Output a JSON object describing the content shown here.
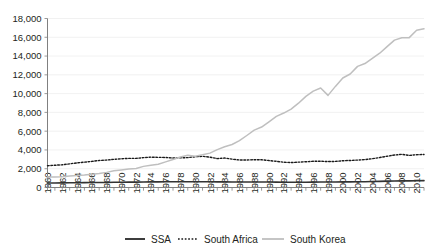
{
  "chart_data": {
    "type": "line",
    "title": "",
    "xlabel": "",
    "ylabel": "",
    "ylim": [
      0,
      18000
    ],
    "xlim": [
      1960,
      2011
    ],
    "grid": true,
    "legend_position": "bottom",
    "y_ticks": [
      "0",
      "2,000",
      "4,000",
      "6,000",
      "8,000",
      "10,000",
      "12,000",
      "14,000",
      "16,000",
      "18,000"
    ],
    "y_tick_values": [
      0,
      2000,
      4000,
      6000,
      8000,
      10000,
      12000,
      14000,
      16000,
      18000
    ],
    "x_tick_labels": [
      "1960",
      "1962",
      "1964",
      "1966",
      "1968",
      "1970",
      "1972",
      "1974",
      "1976",
      "1978",
      "1980",
      "1982",
      "1984",
      "1986",
      "1988",
      "1990",
      "1992",
      "1994",
      "1996",
      "1998",
      "2000",
      "2002",
      "2004",
      "2006",
      "2008",
      "2010"
    ],
    "x": [
      1960,
      1961,
      1962,
      1963,
      1964,
      1965,
      1966,
      1967,
      1968,
      1969,
      1970,
      1971,
      1972,
      1973,
      1974,
      1975,
      1976,
      1977,
      1978,
      1979,
      1980,
      1981,
      1982,
      1983,
      1984,
      1985,
      1986,
      1987,
      1988,
      1989,
      1990,
      1991,
      1992,
      1993,
      1994,
      1995,
      1996,
      1997,
      1998,
      1999,
      2000,
      2001,
      2002,
      2003,
      2004,
      2005,
      2006,
      2007,
      2008,
      2009,
      2010,
      2011
    ],
    "series": [
      {
        "name": "SSA",
        "color": "#333333",
        "style": "solid",
        "width": 1.6,
        "values": [
          480,
          485,
          490,
          500,
          510,
          520,
          525,
          530,
          540,
          555,
          565,
          570,
          575,
          590,
          600,
          600,
          610,
          610,
          615,
          615,
          620,
          615,
          605,
          595,
          595,
          590,
          585,
          585,
          590,
          590,
          585,
          575,
          565,
          560,
          560,
          565,
          575,
          580,
          580,
          585,
          595,
          600,
          605,
          615,
          635,
          655,
          675,
          700,
          715,
          705,
          720,
          730
        ]
      },
      {
        "name": "South Africa",
        "color": "#1a1a1a",
        "style": "dotted",
        "width": 1.4,
        "values": [
          2320,
          2370,
          2420,
          2520,
          2620,
          2700,
          2780,
          2880,
          2920,
          3000,
          3060,
          3100,
          3100,
          3180,
          3230,
          3210,
          3200,
          3140,
          3160,
          3180,
          3280,
          3320,
          3230,
          3080,
          3140,
          3020,
          2930,
          2930,
          2960,
          2950,
          2870,
          2790,
          2690,
          2660,
          2700,
          2740,
          2790,
          2800,
          2760,
          2780,
          2850,
          2880,
          2920,
          2970,
          3070,
          3190,
          3330,
          3460,
          3530,
          3420,
          3490,
          3520
        ]
      },
      {
        "name": "South Korea",
        "color": "#bfbfbf",
        "style": "solid",
        "width": 1.5,
        "values": [
          1110,
          1130,
          1150,
          1220,
          1280,
          1320,
          1420,
          1490,
          1610,
          1780,
          1870,
          1960,
          2020,
          2250,
          2380,
          2480,
          2730,
          2990,
          3250,
          3440,
          3320,
          3480,
          3660,
          4030,
          4340,
          4580,
          4990,
          5540,
          6110,
          6440,
          7000,
          7580,
          7930,
          8350,
          8980,
          9710,
          10260,
          10600,
          9810,
          10770,
          11660,
          12090,
          12900,
          13200,
          13760,
          14300,
          15000,
          15700,
          15950,
          15960,
          16740,
          16900
        ]
      }
    ]
  },
  "legend": {
    "items": [
      {
        "label": "SSA"
      },
      {
        "label": "South Africa"
      },
      {
        "label": "South Korea"
      }
    ]
  }
}
